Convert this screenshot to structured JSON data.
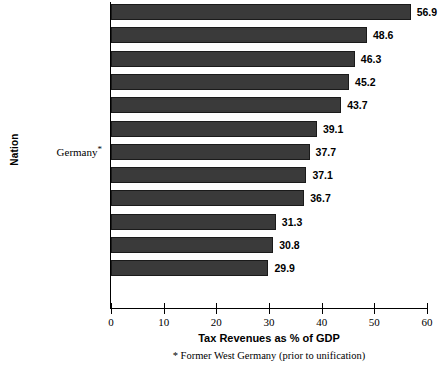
{
  "chart_data": {
    "type": "bar",
    "orientation": "horizontal",
    "title": "",
    "xlabel": "Tax Revenues as % of GDP",
    "ylabel": "Nation",
    "xlim": [
      0,
      60
    ],
    "xticks": [
      "0",
      "10",
      "20",
      "30",
      "40",
      "50",
      "60"
    ],
    "xtick_values": [
      0,
      10,
      20,
      30,
      40,
      50,
      60
    ],
    "grid": false,
    "legend": null,
    "categories": [
      "Sweden",
      "Denmark",
      "Norway",
      "Netherlands",
      "France",
      "Italy",
      "Germany*",
      "Canada",
      "United Kingdom",
      "Japan",
      "Australia",
      "United States"
    ],
    "values": [
      56.9,
      48.6,
      46.3,
      45.2,
      43.7,
      39.1,
      37.7,
      37.1,
      36.7,
      31.3,
      30.8,
      29.9
    ],
    "value_labels": [
      "56.9",
      "48.6",
      "46.3",
      "45.2",
      "43.7",
      "39.1",
      "37.7",
      "37.1",
      "36.7",
      "31.3",
      "30.8",
      "29.9"
    ],
    "annotations": [
      "* Former West Germany (prior to unification)"
    ],
    "bar_color": "#3a3a3a",
    "axis_color": "#000000",
    "background_color": "#ffffff"
  },
  "footnote": "* Former West Germany (prior to unification)"
}
